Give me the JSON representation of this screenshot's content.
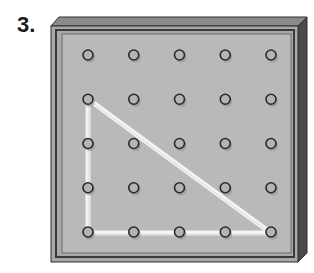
{
  "problem": {
    "number_label": "3."
  },
  "geoboard": {
    "rows": 5,
    "cols": 5,
    "peg_origin": [
      88,
      55
    ],
    "peg_spacing": [
      45.75,
      44.25
    ],
    "colors": {
      "frame_top": "#8a8a8a",
      "frame_side": "#4a4a4a",
      "frame_border": "#2e2e2e",
      "surface": "#b9b9b9",
      "peg_ring": "#2a2a2a",
      "peg_fill": "#b4b4b4",
      "band": "#f4f4f4"
    },
    "rubber_band": {
      "shape": "right-triangle",
      "vertices_peg_index": [
        [
          1,
          0
        ],
        [
          4,
          0
        ],
        [
          4,
          4
        ]
      ]
    }
  }
}
